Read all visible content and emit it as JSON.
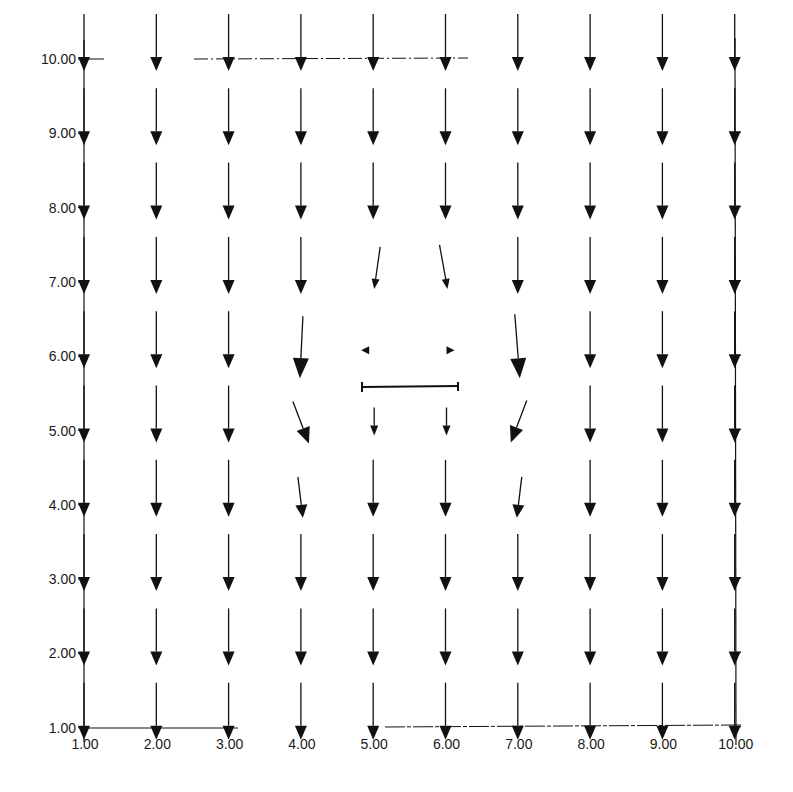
{
  "chart_data": {
    "type": "quiver",
    "title": "",
    "xlabel": "",
    "ylabel": "",
    "xlim": [
      1,
      10
    ],
    "ylim": [
      1,
      10
    ],
    "grid": false,
    "x_ticks": [
      "1.00",
      "2.00",
      "3.00",
      "4.00",
      "5.00",
      "6.00",
      "7.00",
      "8.00",
      "9.00",
      "10.00"
    ],
    "y_ticks": [
      "1.00",
      "2.00",
      "3.00",
      "4.00",
      "5.00",
      "6.00",
      "7.00",
      "8.00",
      "9.00",
      "10.00"
    ],
    "default_vector": {
      "u": 0,
      "v": -1
    },
    "special_vectors": [
      {
        "x": 4,
        "y": 7,
        "u": 0.0,
        "v": -1.0,
        "magnitude": "normal"
      },
      {
        "x": 5,
        "y": 7,
        "u": -0.25,
        "v": -0.7,
        "magnitude": "small"
      },
      {
        "x": 6,
        "y": 7,
        "u": 0.25,
        "v": -0.7,
        "magnitude": "small"
      },
      {
        "x": 7,
        "y": 7,
        "u": 0.0,
        "v": -1.0,
        "magnitude": "normal"
      },
      {
        "x": 4,
        "y": 6,
        "u": -0.02,
        "v": -1.4,
        "magnitude": "large"
      },
      {
        "x": 5,
        "y": 6,
        "u": -0.2,
        "v": 0.0,
        "magnitude": "tiny"
      },
      {
        "x": 6,
        "y": 6,
        "u": 0.2,
        "v": 0.0,
        "magnitude": "tiny"
      },
      {
        "x": 7,
        "y": 6,
        "u": 0.05,
        "v": -1.4,
        "magnitude": "large"
      },
      {
        "x": 4,
        "y": 5,
        "u": 0.45,
        "v": -1.0,
        "magnitude": "large"
      },
      {
        "x": 5,
        "y": 5,
        "u": 0.0,
        "v": -0.6,
        "magnitude": "small"
      },
      {
        "x": 6,
        "y": 5,
        "u": 0.0,
        "v": -0.6,
        "magnitude": "small"
      },
      {
        "x": 7,
        "y": 5,
        "u": -0.45,
        "v": -1.0,
        "magnitude": "large"
      },
      {
        "x": 4,
        "y": 4,
        "u": 0.1,
        "v": -0.9,
        "magnitude": "normal"
      },
      {
        "x": 7,
        "y": 4,
        "u": -0.1,
        "v": -0.9,
        "magnitude": "normal"
      }
    ],
    "annotations": [
      {
        "type": "segment",
        "label": "plate",
        "x0": 4.94,
        "x1": 6.26,
        "y": 5.45
      }
    ]
  },
  "axes": {
    "x_tick_labels": [
      "1.00",
      "2.00",
      "3.00",
      "4.00",
      "5.00",
      "6.00",
      "7.00",
      "8.00",
      "9.00",
      "10.00"
    ],
    "y_tick_labels": [
      "1.00",
      "2.00",
      "3.00",
      "4.00",
      "5.00",
      "6.00",
      "7.00",
      "8.00",
      "9.00",
      "10.00"
    ]
  },
  "style": {
    "ink_color": "#111111",
    "background": "#ffffff"
  }
}
